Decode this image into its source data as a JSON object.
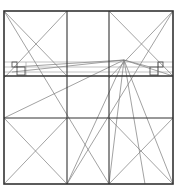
{
  "diagram": {
    "title": "",
    "background": "#ffffff",
    "colors": {
      "thick": "#333333",
      "thin": "#6e6e6e",
      "light": "#9a9a9a"
    },
    "outer_square": {
      "x1": 4,
      "y1": 11,
      "x2": 173,
      "y2": 184
    },
    "vertical_dividers": [
      67,
      109
    ],
    "horizontal_dividers": [
      {
        "y": 76,
        "weight": "thick"
      },
      {
        "y": 118,
        "weight": "medium"
      }
    ],
    "thin_horizontals": [
      62,
      67,
      72
    ],
    "apex_point": {
      "x": 124,
      "y": 60
    },
    "small_squares": [
      {
        "x": 12,
        "y": 62,
        "size": 5
      },
      {
        "x": 17,
        "y": 67,
        "size": 8
      },
      {
        "x": 158,
        "y": 62,
        "size": 5
      },
      {
        "x": 150,
        "y": 67,
        "size": 8
      }
    ]
  }
}
